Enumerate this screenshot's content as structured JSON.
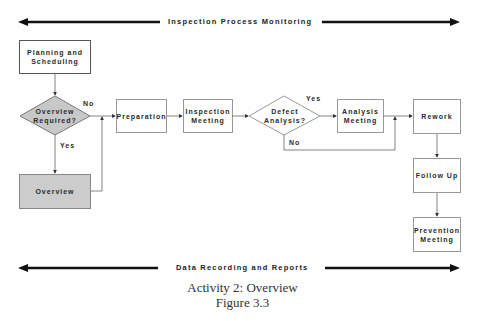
{
  "diagram": {
    "top_banner": "Inspection Process Monitoring",
    "bottom_banner": "Data Recording and Reports",
    "caption_line1": "Activity 2: Overview",
    "caption_line2": "Figure 3.3",
    "nodes": {
      "planning": "Planning and Scheduling",
      "overview_required": "Overview Required?",
      "overview": "Overview",
      "preparation": "Preparation",
      "inspection_meeting": "Inspection Meeting",
      "defect_analysis": "Defect Analysis?",
      "analysis_meeting": "Analysis Meeting",
      "rework": "Rework",
      "follow_up": "Follow Up",
      "prevention_meeting": "Prevention Meeting"
    },
    "edge_labels": {
      "overview_no": "No",
      "overview_yes": "Yes",
      "defect_yes": "Yes",
      "defect_no": "No"
    },
    "colors": {
      "decision_fill": "#c8c8c8",
      "overview_fill": "#cccccc",
      "line": "#555555",
      "banner_arrow": "#111111"
    }
  }
}
